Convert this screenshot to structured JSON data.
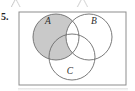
{
  "figure": {
    "problem_number": "5.",
    "caption": "",
    "universe_label": "",
    "colors": {
      "stroke": "#6b6b6b",
      "frame_stroke": "#8d8d8d",
      "shade_fill": "#c9c9c9",
      "page_background": "#ffffff",
      "label_color": "#2b2b2b"
    },
    "frame": {
      "x": 19,
      "y": 12,
      "width": 107,
      "height": 73
    },
    "circles": [
      {
        "id": "A",
        "label": "A",
        "cx": 56,
        "cy": 37,
        "r": 23,
        "label_x": 48,
        "label_y": 24
      },
      {
        "id": "B",
        "label": "B",
        "cx": 89,
        "cy": 37,
        "r": 23,
        "label_x": 94,
        "label_y": 24
      },
      {
        "id": "C",
        "label": "C",
        "cx": 72,
        "cy": 57,
        "r": 23,
        "label_x": 70,
        "label_y": 70
      }
    ],
    "shaded_region": {
      "description": "A minus B",
      "set_expression": "A \\ B",
      "includes_triple_intersection": false
    }
  }
}
